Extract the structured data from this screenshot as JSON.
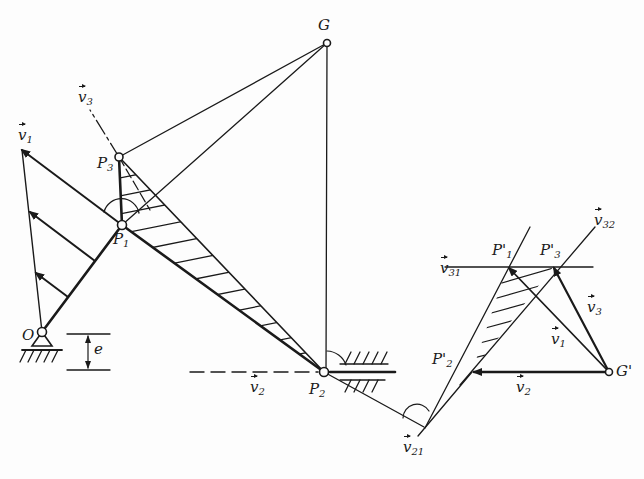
{
  "diagram": {
    "type": "kinematic velocity diagram (slider-crank with pole G and velocity polygon)",
    "colors": {
      "ink": "#1a1a1a",
      "background": "#fdfdfd"
    },
    "points": {
      "O": {
        "label": "O",
        "x": 42,
        "y": 332
      },
      "P1": {
        "label": "P",
        "sub": "1",
        "x": 122,
        "y": 225
      },
      "P3": {
        "label": "P",
        "sub": "3",
        "x": 119,
        "y": 157
      },
      "G": {
        "label": "G",
        "x": 327,
        "y": 43
      },
      "P2": {
        "label": "P",
        "sub": "2",
        "x": 324,
        "y": 372
      },
      "G_prime": {
        "label": "G'",
        "x": 609,
        "y": 372
      },
      "P1_prime": {
        "label": "P'",
        "sub": "1",
        "x": 507,
        "y": 267
      },
      "P2_prime": {
        "label": "P'",
        "sub": "2",
        "x": 472,
        "y": 372
      },
      "P3_prime": {
        "label": "P'",
        "sub": "3",
        "x": 553,
        "y": 267
      }
    },
    "labels": {
      "v1": {
        "base": "v",
        "sub": "1"
      },
      "v2_left": {
        "base": "v",
        "sub": "2"
      },
      "v2_right": {
        "base": "v",
        "sub": "2"
      },
      "v3_left": {
        "base": "v",
        "sub": "3"
      },
      "v3_right": {
        "base": "v",
        "sub": "3"
      },
      "v1_right": {
        "base": "v",
        "sub": "1"
      },
      "v21": {
        "base": "v",
        "sub": "21"
      },
      "v31": {
        "base": "v",
        "sub": "31"
      },
      "v32": {
        "base": "v",
        "sub": "32"
      },
      "e": "e"
    }
  }
}
